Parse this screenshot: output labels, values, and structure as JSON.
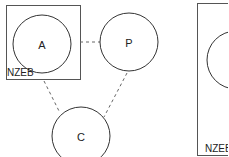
{
  "diagram": {
    "colors": {
      "stroke": "#333333",
      "box_stroke": "#555555",
      "dash": "#666666",
      "text": "#222222",
      "background": "#ffffff"
    },
    "boxes": [
      {
        "id": "box-left",
        "label": "NZEB",
        "x": 6,
        "y": 5,
        "w": 74,
        "h": 74
      },
      {
        "id": "box-right",
        "label": "NZEB",
        "x": 197,
        "y": 3,
        "w": 40,
        "h": 152
      }
    ],
    "nodes": [
      {
        "id": "A",
        "label": "A",
        "cx": 42,
        "cy": 44,
        "r": 29
      },
      {
        "id": "P",
        "label": "P",
        "cx": 129,
        "cy": 42,
        "r": 29
      },
      {
        "id": "C",
        "label": "C",
        "cx": 81,
        "cy": 136,
        "r": 29
      },
      {
        "id": "R",
        "label": "",
        "cx": 236,
        "cy": 60,
        "r": 29
      }
    ],
    "edges": [
      {
        "from": "A",
        "to": "P",
        "style": "dashed",
        "x1": 80,
        "y1": 42,
        "x2": 100,
        "y2": 42
      },
      {
        "from": "A",
        "to": "C",
        "style": "dashed",
        "x1": 44,
        "y1": 81,
        "x2": 59,
        "y2": 111
      },
      {
        "from": "P",
        "to": "C",
        "style": "dashed",
        "x1": 127,
        "y1": 73,
        "x2": 104,
        "y2": 117
      }
    ]
  }
}
